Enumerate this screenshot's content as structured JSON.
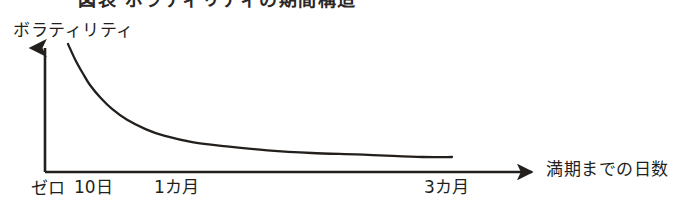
{
  "figure": {
    "cropped_heading_sliver": "図表 ボラティリティの期間構造",
    "background_color": "#ffffff",
    "ink_color": "#231f1c"
  },
  "chart_data": {
    "type": "line",
    "title": "",
    "subtitle": "",
    "xlabel": "満期までの日数",
    "ylabel": "ボラティリティ",
    "grid": false,
    "legend": null,
    "axis_style": "arrowed-open-axes",
    "xlim": [
      0,
      120
    ],
    "ylim": [
      0,
      100
    ],
    "x_tick_labels": [
      "ゼロ",
      "10日",
      "1カ月",
      "3カ月"
    ],
    "x_tick_values": [
      0,
      10,
      30,
      90
    ],
    "y_tick_labels": [],
    "annotations": [],
    "series": [
      {
        "name": "ボラティリティ",
        "color": "#231f1c",
        "x": [
          4,
          6,
          8,
          10,
          13,
          16,
          20,
          25,
          30,
          38,
          47,
          58,
          70,
          82,
          90,
          100,
          108
        ],
        "values": [
          96,
          84,
          74,
          65,
          55,
          47,
          39,
          32,
          27,
          22,
          19,
          16,
          14,
          13,
          12,
          11,
          11
        ]
      }
    ]
  }
}
